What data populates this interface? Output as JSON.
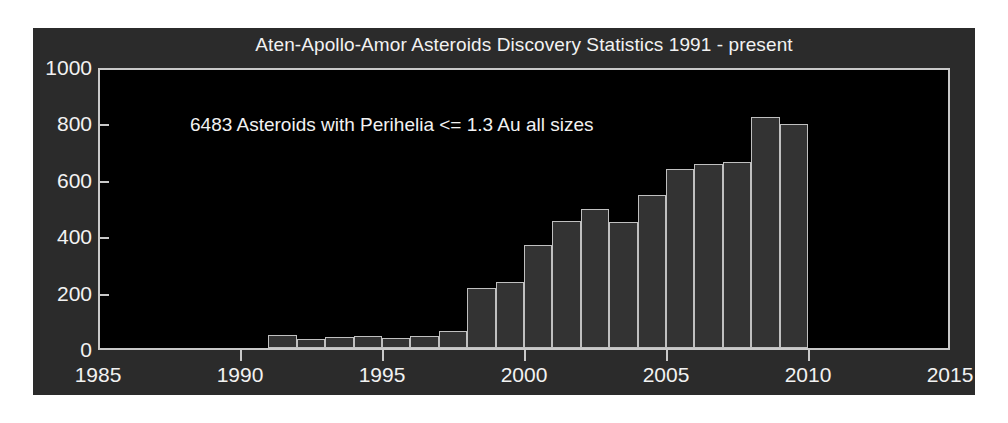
{
  "chart_data": {
    "type": "bar",
    "title": "Aten-Apollo-Amor Asteroids Discovery Statistics 1991 - present",
    "annotation": "6483 Asteroids with Perihelia <= 1.3 Au all sizes",
    "xlabel": "",
    "ylabel": "",
    "xlim": [
      1985,
      2015
    ],
    "ylim": [
      0,
      1000
    ],
    "grid": false,
    "legend": null,
    "xticks": [
      "1985",
      "1990",
      "1995",
      "2000",
      "2005",
      "2010",
      "2015"
    ],
    "xtick_values": [
      1985,
      1990,
      1995,
      2000,
      2005,
      2010,
      2015
    ],
    "yticks": [
      "0",
      "200",
      "400",
      "600",
      "800",
      "1000"
    ],
    "ytick_values": [
      0,
      200,
      400,
      600,
      800,
      1000
    ],
    "bar_width_years": 1,
    "categories": [
      1991,
      1992,
      1993,
      1994,
      1995,
      1996,
      1997,
      1998,
      1999,
      2000,
      2001,
      2002,
      2003,
      2004,
      2005,
      2006,
      2007,
      2008,
      2009
    ],
    "values": [
      45,
      32,
      40,
      44,
      35,
      44,
      62,
      212,
      234,
      367,
      450,
      492,
      448,
      541,
      634,
      651,
      658,
      820,
      793
    ],
    "colors": {
      "figure_background": "#2b2b2b",
      "page_background": "#ffffff",
      "axes_background": "#000000",
      "bar_fill": "#333333",
      "bar_edge": "#c0c0c0",
      "axis_line": "#c9c9c9",
      "text": "#f2f2f2"
    }
  }
}
